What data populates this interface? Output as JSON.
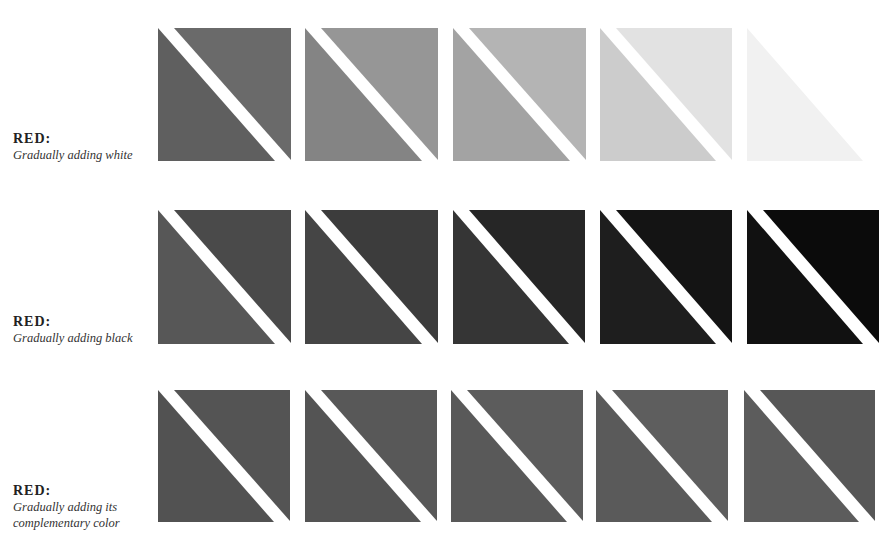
{
  "rows": [
    {
      "label_title": "RED:",
      "label_subtitle": "Gradually adding white",
      "label_top": 130,
      "swatch_top": 28,
      "swatches": [
        {
          "left": 158,
          "width": 133,
          "height": 133,
          "lower_color": "#5f5f5f",
          "upper_color": "#6a6a6a"
        },
        {
          "left": 305,
          "width": 133,
          "height": 133,
          "lower_color": "#848484",
          "upper_color": "#969696"
        },
        {
          "left": 453,
          "width": 133,
          "height": 133,
          "lower_color": "#a3a3a3",
          "upper_color": "#b4b4b4"
        },
        {
          "left": 600,
          "width": 132,
          "height": 133,
          "lower_color": "#cccccc",
          "upper_color": "#e2e2e2"
        },
        {
          "left": 747,
          "width": 132,
          "height": 133,
          "lower_color": "#f1f1f1",
          "upper_color": "#ffffff"
        }
      ]
    },
    {
      "label_title": "RED:",
      "label_subtitle": "Gradually adding black",
      "label_top": 313,
      "swatch_top": 210,
      "swatches": [
        {
          "left": 158,
          "width": 133,
          "height": 134,
          "lower_color": "#575757",
          "upper_color": "#4a4a4a"
        },
        {
          "left": 305,
          "width": 133,
          "height": 134,
          "lower_color": "#454545",
          "upper_color": "#3c3c3c"
        },
        {
          "left": 453,
          "width": 132,
          "height": 134,
          "lower_color": "#353535",
          "upper_color": "#262626"
        },
        {
          "left": 600,
          "width": 132,
          "height": 134,
          "lower_color": "#1e1e1e",
          "upper_color": "#141414"
        },
        {
          "left": 747,
          "width": 132,
          "height": 134,
          "lower_color": "#111111",
          "upper_color": "#0b0b0b"
        }
      ]
    },
    {
      "label_title": "RED:",
      "label_subtitle": "Gradually adding its complementary color",
      "label_subtitle_line1": "Gradually adding its",
      "label_subtitle_line2": "complementary color",
      "label_top": 482,
      "swatch_top": 390,
      "swatches": [
        {
          "left": 158,
          "width": 132,
          "height": 132,
          "lower_color": "#525252",
          "upper_color": "#545454"
        },
        {
          "left": 305,
          "width": 132,
          "height": 132,
          "lower_color": "#545454",
          "upper_color": "#585858"
        },
        {
          "left": 451,
          "width": 132,
          "height": 132,
          "lower_color": "#595959",
          "upper_color": "#5c5c5c"
        },
        {
          "left": 596,
          "width": 132,
          "height": 132,
          "lower_color": "#5a5a5a",
          "upper_color": "#5e5e5e"
        },
        {
          "left": 744,
          "width": 131,
          "height": 132,
          "lower_color": "#5c5c5c",
          "upper_color": "#575757"
        }
      ]
    }
  ]
}
